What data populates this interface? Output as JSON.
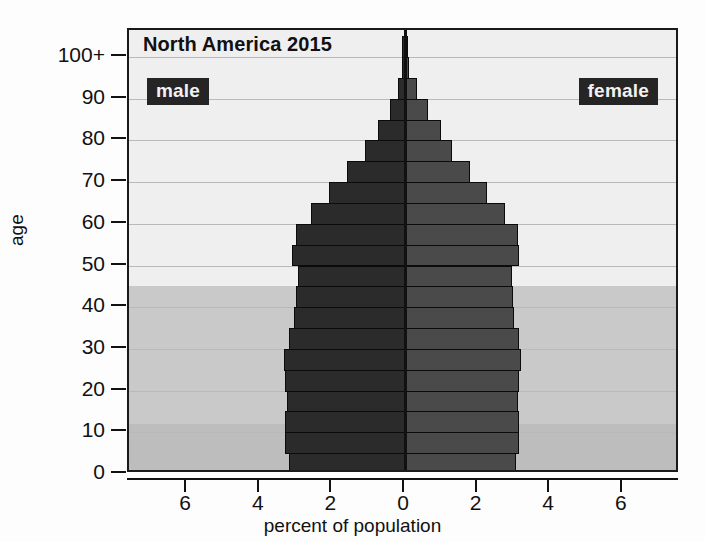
{
  "chart_data": {
    "type": "bar",
    "chart_variant": "population-pyramid",
    "title": "North America 2015",
    "xlabel": "percent of population",
    "ylabel": "age",
    "xlim": [
      -7.6,
      7.6
    ],
    "xticks": [
      6,
      4,
      2,
      0,
      2,
      4,
      6
    ],
    "xtick_labels": [
      "6",
      "4",
      "2",
      "0",
      "2",
      "4",
      "6"
    ],
    "xtick_values": [
      -6,
      -4,
      -2,
      0,
      2,
      4,
      6
    ],
    "yticks": [
      0,
      10,
      20,
      30,
      40,
      50,
      60,
      70,
      80,
      90,
      100
    ],
    "ytick_labels": [
      "0",
      "10",
      "20",
      "30",
      "40",
      "50",
      "60",
      "70",
      "80",
      "90",
      "100+"
    ],
    "ylim": [
      0,
      105
    ],
    "grid": true,
    "legend": [
      "male",
      "female"
    ],
    "legend_position": "inside-top-left and inside-top-right",
    "categories": [
      "0-4",
      "5-9",
      "10-14",
      "15-19",
      "20-24",
      "25-29",
      "30-34",
      "35-39",
      "40-44",
      "45-49",
      "50-54",
      "55-59",
      "60-64",
      "65-69",
      "70-74",
      "75-79",
      "80-84",
      "85-89",
      "90-94",
      "95-99",
      "100+"
    ],
    "series": [
      {
        "name": "male",
        "side": "left",
        "color": "#2b2b2b",
        "values": [
          3.2,
          3.3,
          3.3,
          3.25,
          3.3,
          3.32,
          3.2,
          3.05,
          3.0,
          2.95,
          3.12,
          3.0,
          2.6,
          2.1,
          1.6,
          1.1,
          0.75,
          0.42,
          0.18,
          0.06,
          0.02
        ]
      },
      {
        "name": "female",
        "side": "right",
        "color": "#4a4a4a",
        "values": [
          3.05,
          3.15,
          3.15,
          3.1,
          3.15,
          3.2,
          3.15,
          3.0,
          2.98,
          2.95,
          3.15,
          3.1,
          2.75,
          2.25,
          1.8,
          1.3,
          0.98,
          0.62,
          0.32,
          0.12,
          0.04
        ]
      }
    ],
    "background_bands": [
      {
        "name": "older-dependents-band",
        "from_age": 45,
        "to_age": 105,
        "color": "#efefef"
      },
      {
        "name": "working-age-band",
        "from_age": 12,
        "to_age": 45,
        "color": "#c9c9c9"
      },
      {
        "name": "young-dependents-band",
        "from_age": 0,
        "to_age": 12,
        "color": "#bdbdbd"
      }
    ]
  },
  "labels": {
    "male": "male",
    "female": "female"
  }
}
